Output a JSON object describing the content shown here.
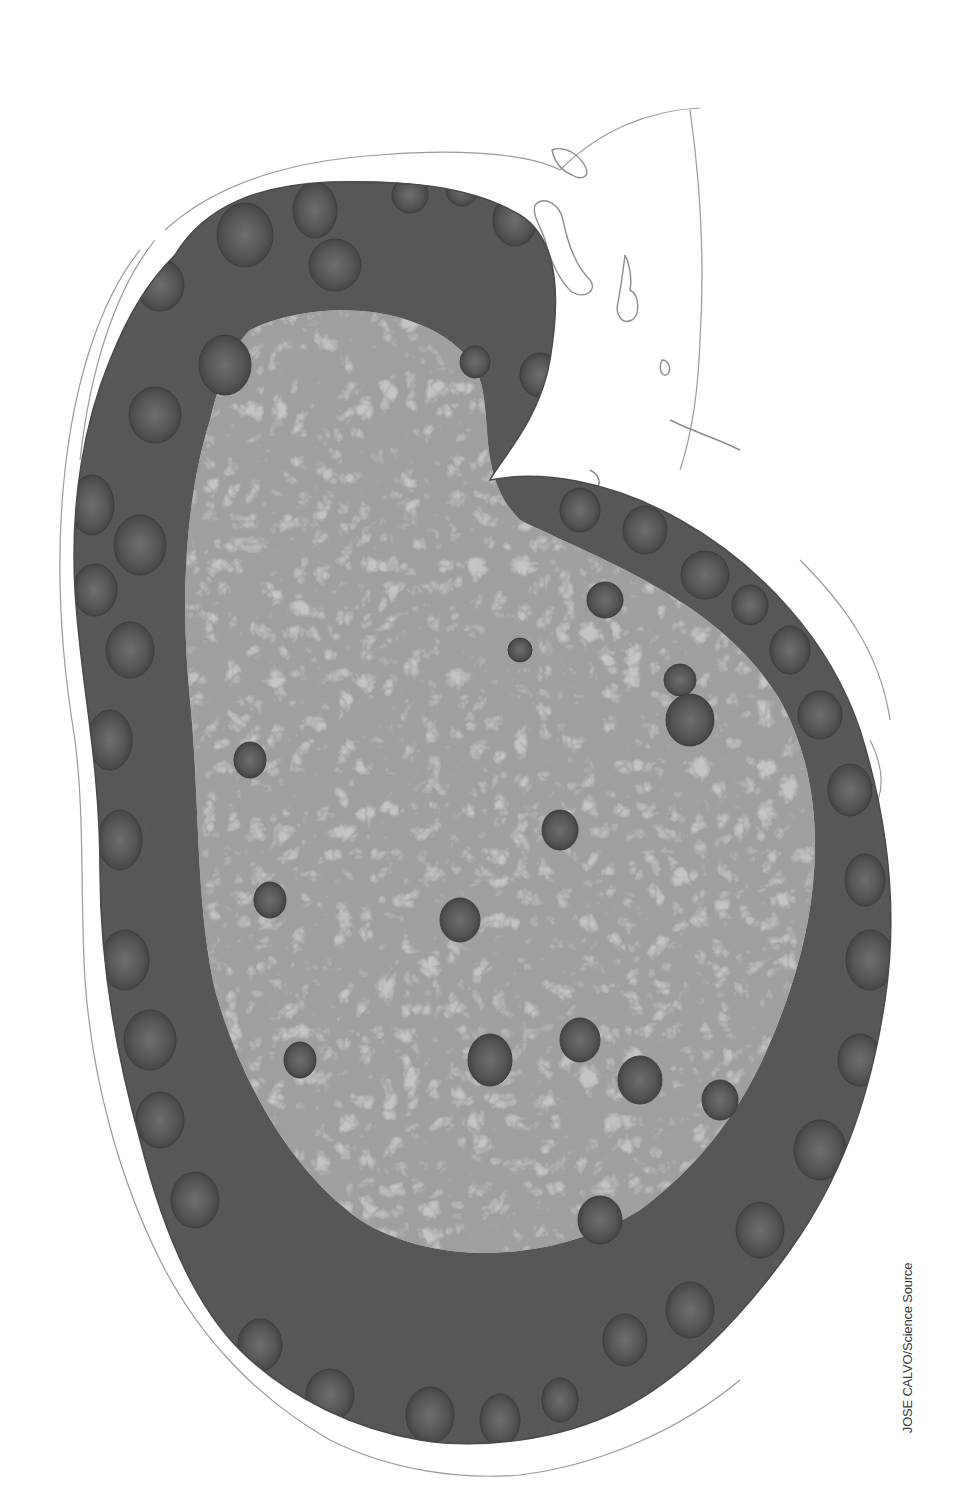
{
  "image": {
    "subject": "lymph-node-histology-micrograph",
    "style": "grayscale",
    "colors": {
      "background": "#ffffff",
      "cortex": "#5a5a5a",
      "follicle": "#4e4e4e",
      "medulla_light": "#c9c9c9",
      "medulla_dark": "#6e6e6e",
      "capsule_line": "#8a8a8a"
    }
  },
  "credit": {
    "text": "JOSE CALVO/Science Source"
  }
}
